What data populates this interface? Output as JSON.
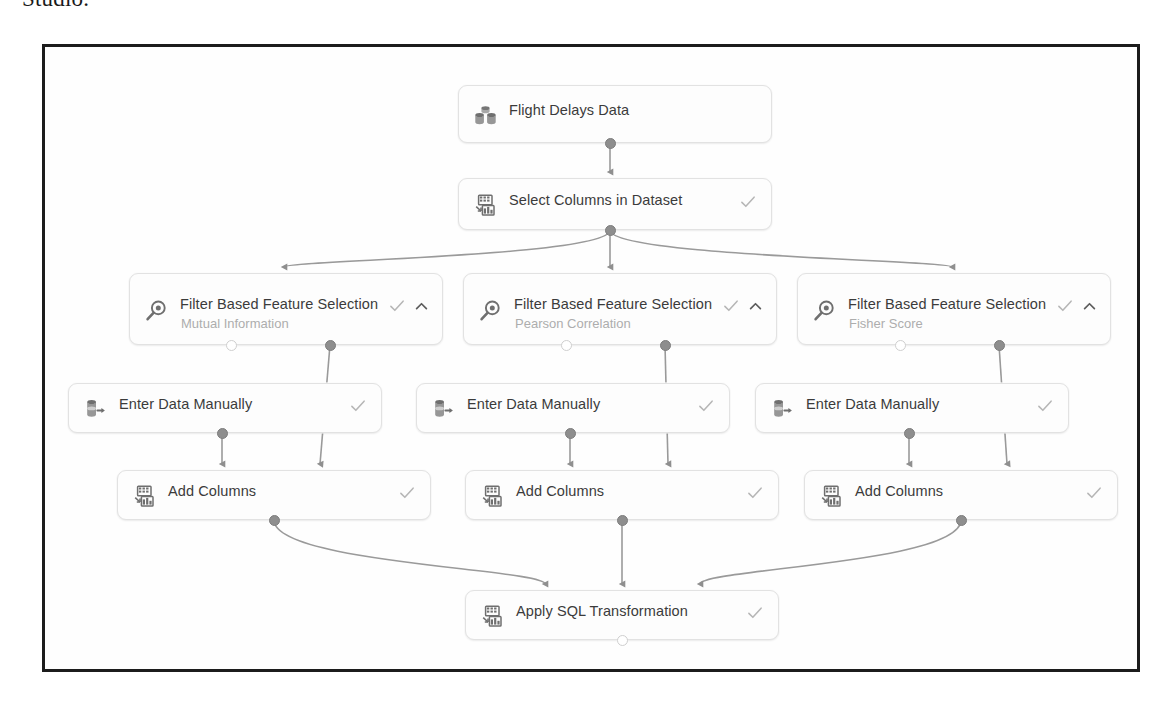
{
  "caption": {
    "text": "Studio."
  },
  "canvas": {
    "name": "pipeline-graph-canvas",
    "border_color": "#1c1c1c",
    "background": "#fefefe"
  },
  "theme": {
    "node_background": "#fdfdfd",
    "node_border": "#e2e2e2",
    "title_color": "#3b3b3b",
    "subtitle_color": "#adadad",
    "edge_color": "#9a9a9a",
    "port_filled_color": "#8e8e8e",
    "port_hollow_color": "#ffffff",
    "check_color": "#b6b6b6"
  },
  "icons": {
    "dataset": "dataset-cylinders-icon",
    "columns": "columns-grid-icon",
    "filter": "magnifier-filter-icon",
    "enter_data": "data-entry-cylinder-arrow-icon",
    "check": "check-icon",
    "chevron_up": "chevron-up-icon"
  },
  "nodes": [
    {
      "id": "flight-delays-data",
      "title": "Flight Delays Data",
      "subtitle": "",
      "icon": "dataset-cylinders-icon",
      "has_check": false,
      "has_chevron": false,
      "x": 458,
      "y": 85,
      "w": 314,
      "h": 58
    },
    {
      "id": "select-columns-in-dataset",
      "title": "Select Columns in Dataset",
      "subtitle": "",
      "icon": "columns-grid-icon",
      "has_check": true,
      "has_chevron": false,
      "x": 458,
      "y": 178,
      "w": 314,
      "h": 52
    },
    {
      "id": "filter-based-feature-selection-mutual-information",
      "title": "Filter Based Feature Selection",
      "subtitle": "Mutual Information",
      "icon": "magnifier-filter-icon",
      "has_check": true,
      "has_chevron": true,
      "x": 129,
      "y": 273,
      "w": 314,
      "h": 72
    },
    {
      "id": "filter-based-feature-selection-pearson-correlation",
      "title": "Filter Based Feature Selection",
      "subtitle": "Pearson Correlation",
      "icon": "magnifier-filter-icon",
      "has_check": true,
      "has_chevron": true,
      "x": 463,
      "y": 273,
      "w": 314,
      "h": 72
    },
    {
      "id": "filter-based-feature-selection-fisher-score",
      "title": "Filter Based Feature Selection",
      "subtitle": "Fisher Score",
      "icon": "magnifier-filter-icon",
      "has_check": true,
      "has_chevron": true,
      "x": 797,
      "y": 273,
      "w": 314,
      "h": 72
    },
    {
      "id": "enter-data-manually-1",
      "title": "Enter Data Manually",
      "subtitle": "",
      "icon": "data-entry-cylinder-arrow-icon",
      "has_check": true,
      "has_chevron": false,
      "x": 68,
      "y": 383,
      "w": 314,
      "h": 50
    },
    {
      "id": "enter-data-manually-2",
      "title": "Enter Data Manually",
      "subtitle": "",
      "icon": "data-entry-cylinder-arrow-icon",
      "has_check": true,
      "has_chevron": false,
      "x": 416,
      "y": 383,
      "w": 314,
      "h": 50
    },
    {
      "id": "enter-data-manually-3",
      "title": "Enter Data Manually",
      "subtitle": "",
      "icon": "data-entry-cylinder-arrow-icon",
      "has_check": true,
      "has_chevron": false,
      "x": 755,
      "y": 383,
      "w": 314,
      "h": 50
    },
    {
      "id": "add-columns-1",
      "title": "Add Columns",
      "subtitle": "",
      "icon": "columns-grid-icon",
      "has_check": true,
      "has_chevron": false,
      "x": 117,
      "y": 470,
      "w": 314,
      "h": 50
    },
    {
      "id": "add-columns-2",
      "title": "Add Columns",
      "subtitle": "",
      "icon": "columns-grid-icon",
      "has_check": true,
      "has_chevron": false,
      "x": 465,
      "y": 470,
      "w": 314,
      "h": 50
    },
    {
      "id": "add-columns-3",
      "title": "Add Columns",
      "subtitle": "",
      "icon": "columns-grid-icon",
      "has_check": true,
      "has_chevron": false,
      "x": 804,
      "y": 470,
      "w": 314,
      "h": 50
    },
    {
      "id": "apply-sql-transformation",
      "title": "Apply SQL Transformation",
      "subtitle": "",
      "icon": "columns-grid-icon",
      "has_check": true,
      "has_chevron": false,
      "x": 465,
      "y": 590,
      "w": 314,
      "h": 50
    }
  ],
  "ports": [
    {
      "name": "flight-delays-data-output",
      "type": "filled",
      "x": 610,
      "y": 143
    },
    {
      "name": "select-columns-input",
      "type": "arrow",
      "x": 610,
      "y": 178
    },
    {
      "name": "select-columns-output",
      "type": "filled",
      "x": 610,
      "y": 230
    },
    {
      "name": "filter-1-input",
      "type": "arrow",
      "x": 284,
      "y": 273
    },
    {
      "name": "filter-1-output-left",
      "type": "hollow",
      "x": 231,
      "y": 345
    },
    {
      "name": "filter-1-output-right",
      "type": "filled",
      "x": 330,
      "y": 345
    },
    {
      "name": "filter-2-input",
      "type": "arrow",
      "x": 610,
      "y": 273
    },
    {
      "name": "filter-2-output-left",
      "type": "hollow",
      "x": 566,
      "y": 345
    },
    {
      "name": "filter-2-output-right",
      "type": "filled",
      "x": 665,
      "y": 345
    },
    {
      "name": "filter-3-input",
      "type": "arrow",
      "x": 952,
      "y": 273
    },
    {
      "name": "filter-3-output-left",
      "type": "hollow",
      "x": 900,
      "y": 345
    },
    {
      "name": "filter-3-output-right",
      "type": "filled",
      "x": 999,
      "y": 345
    },
    {
      "name": "enter-data-1-output",
      "type": "filled",
      "x": 222,
      "y": 433
    },
    {
      "name": "enter-data-2-output",
      "type": "filled",
      "x": 570,
      "y": 433
    },
    {
      "name": "enter-data-3-output",
      "type": "filled",
      "x": 909,
      "y": 433
    },
    {
      "name": "add-columns-1-input-left",
      "type": "arrow",
      "x": 222,
      "y": 470
    },
    {
      "name": "add-columns-1-input-right",
      "type": "arrow",
      "x": 320,
      "y": 470
    },
    {
      "name": "add-columns-2-input-left",
      "type": "arrow",
      "x": 570,
      "y": 470
    },
    {
      "name": "add-columns-2-input-right",
      "type": "arrow",
      "x": 668,
      "y": 470
    },
    {
      "name": "add-columns-3-input-left",
      "type": "arrow",
      "x": 909,
      "y": 470
    },
    {
      "name": "add-columns-3-input-right",
      "type": "arrow",
      "x": 1007,
      "y": 470
    },
    {
      "name": "add-columns-1-output",
      "type": "filled",
      "x": 274,
      "y": 520
    },
    {
      "name": "add-columns-2-output",
      "type": "filled",
      "x": 622,
      "y": 520
    },
    {
      "name": "add-columns-3-output",
      "type": "filled",
      "x": 961,
      "y": 520
    },
    {
      "name": "apply-sql-input-left",
      "type": "arrow",
      "x": 545,
      "y": 590
    },
    {
      "name": "apply-sql-input-center",
      "type": "arrow",
      "x": 622,
      "y": 590
    },
    {
      "name": "apply-sql-input-right",
      "type": "arrow",
      "x": 700,
      "y": 590
    },
    {
      "name": "apply-sql-output",
      "type": "hollow",
      "x": 622,
      "y": 640
    }
  ],
  "edges": [
    {
      "name": "edge-flight-delays-to-select-columns",
      "from": "flight-delays-data",
      "to": "select-columns-in-dataset"
    },
    {
      "name": "edge-select-columns-to-filter-1",
      "from": "select-columns-in-dataset",
      "to": "filter-based-feature-selection-mutual-information"
    },
    {
      "name": "edge-select-columns-to-filter-2",
      "from": "select-columns-in-dataset",
      "to": "filter-based-feature-selection-pearson-correlation"
    },
    {
      "name": "edge-select-columns-to-filter-3",
      "from": "select-columns-in-dataset",
      "to": "filter-based-feature-selection-fisher-score"
    },
    {
      "name": "edge-filter-1-to-add-columns-1",
      "from": "filter-based-feature-selection-mutual-information",
      "to": "add-columns-1"
    },
    {
      "name": "edge-filter-2-to-add-columns-2",
      "from": "filter-based-feature-selection-pearson-correlation",
      "to": "add-columns-2"
    },
    {
      "name": "edge-filter-3-to-add-columns-3",
      "from": "filter-based-feature-selection-fisher-score",
      "to": "add-columns-3"
    },
    {
      "name": "edge-enter-data-1-to-add-columns-1",
      "from": "enter-data-manually-1",
      "to": "add-columns-1"
    },
    {
      "name": "edge-enter-data-2-to-add-columns-2",
      "from": "enter-data-manually-2",
      "to": "add-columns-2"
    },
    {
      "name": "edge-enter-data-3-to-add-columns-3",
      "from": "enter-data-manually-3",
      "to": "add-columns-3"
    },
    {
      "name": "edge-add-columns-1-to-apply-sql",
      "from": "add-columns-1",
      "to": "apply-sql-transformation"
    },
    {
      "name": "edge-add-columns-2-to-apply-sql",
      "from": "add-columns-2",
      "to": "apply-sql-transformation"
    },
    {
      "name": "edge-add-columns-3-to-apply-sql",
      "from": "add-columns-3",
      "to": "apply-sql-transformation"
    }
  ]
}
